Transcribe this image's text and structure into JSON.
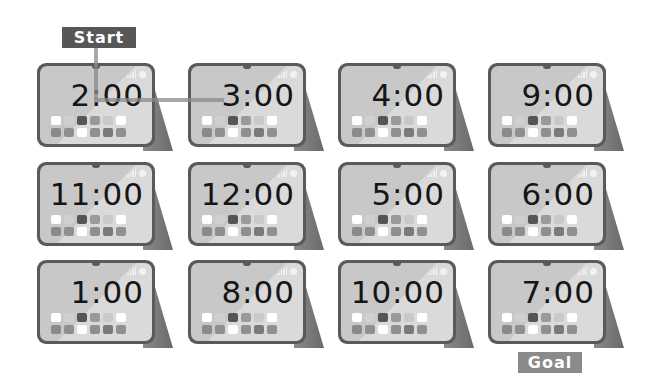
{
  "labels": {
    "start": "Start",
    "goal": "Goal"
  },
  "colors": {
    "start_label_bg": "#575757",
    "goal_label_bg": "#8a8a8a",
    "path_line": "#8a8a8a",
    "tablet_frame": "#5a5a5a",
    "screen_light": "#dadada",
    "screen_dark": "#c8c8c8"
  },
  "grid": {
    "rows": 3,
    "columns": 4
  },
  "tablets": [
    {
      "row": 1,
      "col": 1,
      "time": "2:00",
      "role": "start"
    },
    {
      "row": 1,
      "col": 2,
      "time": "3:00"
    },
    {
      "row": 1,
      "col": 3,
      "time": "4:00"
    },
    {
      "row": 1,
      "col": 4,
      "time": "9:00"
    },
    {
      "row": 2,
      "col": 1,
      "time": "11:00"
    },
    {
      "row": 2,
      "col": 2,
      "time": "12:00"
    },
    {
      "row": 2,
      "col": 3,
      "time": "5:00"
    },
    {
      "row": 2,
      "col": 4,
      "time": "6:00"
    },
    {
      "row": 3,
      "col": 1,
      "time": "1:00"
    },
    {
      "row": 3,
      "col": 2,
      "time": "8:00"
    },
    {
      "row": 3,
      "col": 3,
      "time": "10:00"
    },
    {
      "row": 3,
      "col": 4,
      "time": "7:00",
      "role": "goal"
    }
  ],
  "drawn_path": [
    "2:00",
    "3:00"
  ],
  "icons": {
    "status_signal": "signal-bars-icon",
    "status_wifi": "wifi-icon"
  }
}
